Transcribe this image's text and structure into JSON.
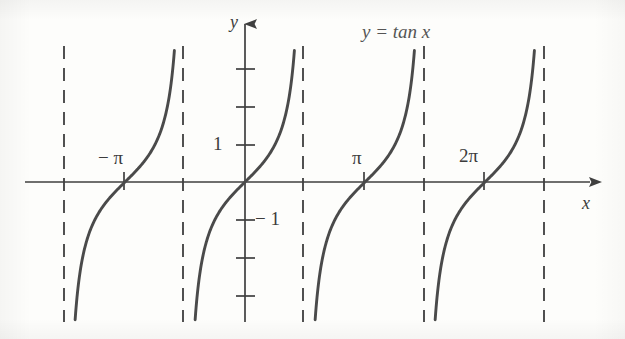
{
  "figure": {
    "title": "y = tan x",
    "background_color": "#fdfdfb",
    "curve_color": "#4a4a4a",
    "axis_color": "#3f3f3f",
    "asymptote_color": "#333333"
  },
  "axes": {
    "x_label": "x",
    "y_label": "y"
  },
  "labels": {
    "y_pos_1": "1",
    "y_neg_1": "− 1",
    "x_neg_pi": "− π",
    "x_pi": "π",
    "x_2pi": "2π"
  },
  "chart_data": {
    "type": "line",
    "title": "y = tan x",
    "xlabel": "x",
    "ylabel": "y",
    "function": "y = tan x",
    "grid": false,
    "legend": null,
    "xlim": [
      -4.71238898038469,
      9.42477796076938
    ],
    "ylim": [
      -4.8,
      4.8
    ],
    "x_tick_labels": [
      "− π",
      "π",
      "2π"
    ],
    "x_tick_values": [
      -3.141592653589793,
      3.141592653589793,
      6.283185307179586
    ],
    "y_tick_labels": [
      "1",
      "− 1"
    ],
    "y_tick_values": [
      1,
      -1
    ],
    "y_tick_values_unlabeled": [
      3,
      2,
      -2,
      -3,
      -4
    ],
    "zero_crossings": [
      -3.141592653589793,
      0,
      3.141592653589793,
      6.283185307179586
    ],
    "asymptotes": [
      -4.71238898038469,
      -1.570796326794897,
      1.570796326794897,
      4.71238898038469,
      7.853981633974483
    ],
    "asymptote_style": "dashed",
    "branches": [
      {
        "x_range": [
          -4.71238898038469,
          -1.570796326794897
        ],
        "center": -3.141592653589793
      },
      {
        "x_range": [
          -1.570796326794897,
          1.570796326794897
        ],
        "center": 0
      },
      {
        "x_range": [
          1.570796326794897,
          4.71238898038469
        ],
        "center": 3.141592653589793
      },
      {
        "x_range": [
          4.71238898038469,
          7.853981633974483
        ],
        "center": 6.283185307179586
      }
    ],
    "annotations": [
      {
        "text": "y = tan x",
        "x": 2.6,
        "y": 4.3
      }
    ]
  },
  "geometry": {
    "x_axis_y_px": 182,
    "y_axis_x_px": 245,
    "unit_y_px": 37.5,
    "unit_x_px": 38.2,
    "x_axis_start_px": 25,
    "x_axis_end_px": 598,
    "y_axis_top_px": 12,
    "y_axis_bottom_px": 322,
    "asymptote_top_px": 46,
    "asymptote_bottom_px": 322,
    "curve_top_px": 46,
    "curve_bottom_px": 322
  }
}
